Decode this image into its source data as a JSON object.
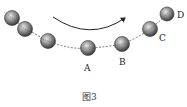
{
  "figure": {
    "caption": "图3",
    "labels": {
      "A": "A",
      "B": "B",
      "C": "C",
      "D": "D"
    },
    "colors": {
      "ball_dark": "#3a3a3a",
      "ball_light": "#d8d8d8",
      "path": "#555555",
      "arrow": "#222222"
    },
    "balls": [
      {
        "cx": 12,
        "cy": 18,
        "r": 7.5,
        "label": ""
      },
      {
        "cx": 25,
        "cy": 29,
        "r": 7.5,
        "label": ""
      },
      {
        "cx": 48,
        "cy": 41,
        "r": 7.5,
        "label": ""
      },
      {
        "cx": 88,
        "cy": 48,
        "r": 7.5,
        "label": "A"
      },
      {
        "cx": 122,
        "cy": 44,
        "r": 7.5,
        "label": "B"
      },
      {
        "cx": 150,
        "cy": 29,
        "r": 7.5,
        "label": "C"
      },
      {
        "cx": 167,
        "cy": 14,
        "r": 7,
        "label": "D"
      }
    ],
    "motion_arrow": {
      "direction": "left-to-right",
      "shape": "arc"
    }
  }
}
